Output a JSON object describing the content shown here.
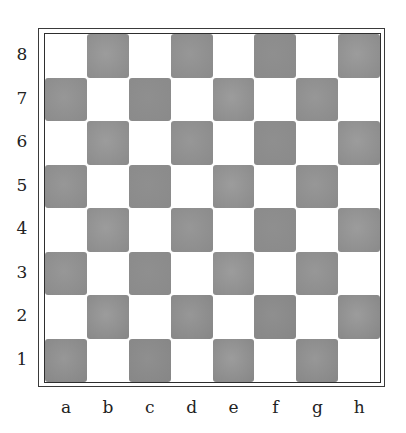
{
  "board": {
    "ranks": [
      "8",
      "7",
      "6",
      "5",
      "4",
      "3",
      "2",
      "1"
    ],
    "files": [
      "a",
      "b",
      "c",
      "d",
      "e",
      "f",
      "g",
      "h"
    ],
    "light_color": "#ffffff",
    "dark_color": "#9a9a9a",
    "dark_color_edge": "#8a8a8a",
    "border_color": "#333333",
    "description": "Empty chessboard with watercolor-style gray dark squares, rank labels 1-8 on the left and file labels a-h along the bottom"
  }
}
